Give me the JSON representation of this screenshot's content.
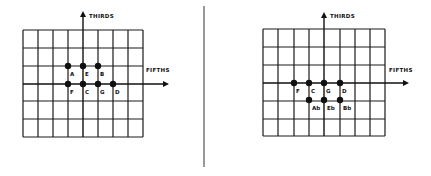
{
  "panels": [
    {
      "id": "left",
      "axes": {
        "vertical_label": "THIRDS",
        "horizontal_label": "FIFTHS"
      },
      "grid": {
        "cols": 8,
        "rows": 6
      },
      "points": [
        {
          "note": "A",
          "row": "upper"
        },
        {
          "note": "E",
          "row": "upper"
        },
        {
          "note": "B",
          "row": "upper"
        },
        {
          "note": "F",
          "row": "axis"
        },
        {
          "note": "C",
          "row": "axis"
        },
        {
          "note": "G",
          "row": "axis"
        },
        {
          "note": "D",
          "row": "axis"
        }
      ]
    },
    {
      "id": "right",
      "axes": {
        "vertical_label": "THIRDS",
        "horizontal_label": "FIFTHS"
      },
      "grid": {
        "cols": 8,
        "rows": 6
      },
      "points": [
        {
          "note": "F",
          "row": "axis"
        },
        {
          "note": "C",
          "row": "axis"
        },
        {
          "note": "G",
          "row": "axis"
        },
        {
          "note": "D",
          "row": "axis"
        },
        {
          "note": "Ab",
          "row": "lower"
        },
        {
          "note": "Eb",
          "row": "lower"
        },
        {
          "note": "Bb",
          "row": "lower"
        }
      ]
    }
  ],
  "colors": {
    "ink": "#111111",
    "divider": "#777777",
    "background": "#ffffff"
  }
}
